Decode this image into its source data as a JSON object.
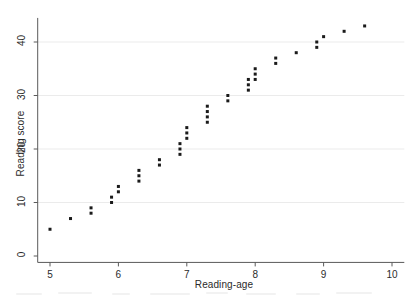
{
  "figure": {
    "background_color": "#ffffff",
    "axis_color": "#5a5a5a",
    "grid_color": "#ebebeb",
    "marker_color": "#1a1a1a",
    "text_color": "#2b2b2b"
  },
  "chart_data": {
    "type": "scatter",
    "title": "",
    "xlabel": "Reading-age",
    "ylabel": "Reading score",
    "xlim": [
      4.82,
      10.18
    ],
    "ylim": [
      -1.2,
      44.5
    ],
    "xticks": [
      5,
      6,
      7,
      8,
      9,
      10
    ],
    "xtick_labels": [
      "5",
      "6",
      "7",
      "8",
      "9",
      "10"
    ],
    "yticks": [
      0,
      10,
      20,
      30,
      40
    ],
    "ytick_labels": [
      "0",
      "10",
      "20",
      "30",
      "40"
    ],
    "grid": "horizontal-only",
    "legend": null,
    "marker": "square",
    "marker_size": 3,
    "points": [
      {
        "x": 5.0,
        "y": 5
      },
      {
        "x": 5.3,
        "y": 7
      },
      {
        "x": 5.6,
        "y": 8
      },
      {
        "x": 5.6,
        "y": 9
      },
      {
        "x": 5.9,
        "y": 10
      },
      {
        "x": 5.9,
        "y": 11
      },
      {
        "x": 6.0,
        "y": 12
      },
      {
        "x": 6.0,
        "y": 13
      },
      {
        "x": 6.3,
        "y": 14
      },
      {
        "x": 6.3,
        "y": 15
      },
      {
        "x": 6.3,
        "y": 16
      },
      {
        "x": 6.6,
        "y": 17
      },
      {
        "x": 6.6,
        "y": 18
      },
      {
        "x": 6.9,
        "y": 19
      },
      {
        "x": 6.9,
        "y": 20
      },
      {
        "x": 6.9,
        "y": 21
      },
      {
        "x": 7.0,
        "y": 22
      },
      {
        "x": 7.0,
        "y": 23
      },
      {
        "x": 7.0,
        "y": 24
      },
      {
        "x": 7.3,
        "y": 25
      },
      {
        "x": 7.3,
        "y": 26
      },
      {
        "x": 7.3,
        "y": 27
      },
      {
        "x": 7.3,
        "y": 28
      },
      {
        "x": 7.6,
        "y": 29
      },
      {
        "x": 7.6,
        "y": 30
      },
      {
        "x": 7.9,
        "y": 31
      },
      {
        "x": 7.9,
        "y": 32
      },
      {
        "x": 7.9,
        "y": 33
      },
      {
        "x": 8.0,
        "y": 33
      },
      {
        "x": 8.0,
        "y": 34
      },
      {
        "x": 8.0,
        "y": 35
      },
      {
        "x": 8.3,
        "y": 36
      },
      {
        "x": 8.3,
        "y": 37
      },
      {
        "x": 8.6,
        "y": 38
      },
      {
        "x": 8.9,
        "y": 39
      },
      {
        "x": 8.9,
        "y": 40
      },
      {
        "x": 9.0,
        "y": 41
      },
      {
        "x": 9.3,
        "y": 42
      },
      {
        "x": 9.6,
        "y": 43
      }
    ]
  }
}
